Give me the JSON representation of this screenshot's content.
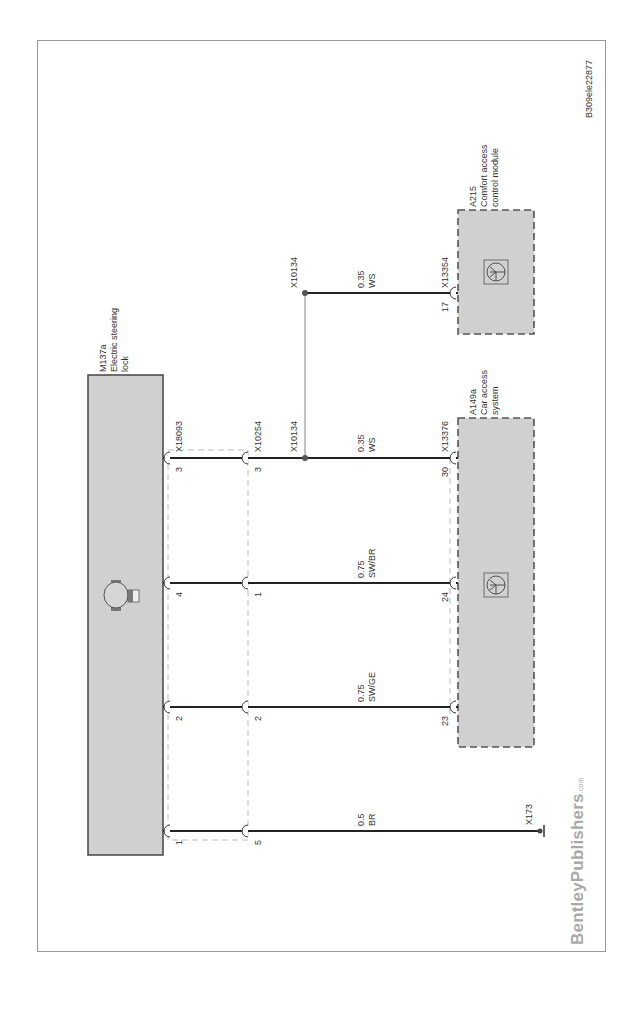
{
  "figure_id": "B309ele22877",
  "publisher_logo": {
    "name": "BentleyPublishers",
    "suffix": ".com"
  },
  "colors": {
    "component_fill": "#d0d0d0",
    "wire": "#222222",
    "frame": "#9a9a9a",
    "dashed_outline": "#555555",
    "logo": "#a9a9a9"
  },
  "components": {
    "m137a": {
      "id": "M137a",
      "name_line1": "Electric steering",
      "name_line2": "lock"
    },
    "a149a": {
      "id": "A149a",
      "name_line1": "Car access",
      "name_line2": "system"
    },
    "a215": {
      "id": "A215",
      "name_line1": "Comfort access",
      "name_line2": "control module"
    }
  },
  "connectors": {
    "x18093": "X18093",
    "x10254": "X10254",
    "x13376": "X13376",
    "x13354": "X13354",
    "x173": "X173",
    "splice_x10134": "X10134"
  },
  "wires": [
    {
      "m137a_pin": "3",
      "x10254_pin": "3",
      "end_pin": "30",
      "gauge": "0.35",
      "color": "WS"
    },
    {
      "m137a_pin": "4",
      "x10254_pin": "1",
      "end_pin": "24",
      "gauge": "0.75",
      "color": "SW/BR"
    },
    {
      "m137a_pin": "2",
      "x10254_pin": "2",
      "end_pin": "23",
      "gauge": "0.75",
      "color": "SW/GE"
    },
    {
      "m137a_pin": "1",
      "x10254_pin": "5",
      "end_pin": "",
      "gauge": "0.5",
      "color": "BR"
    }
  ],
  "branch_wire": {
    "end_pin": "17",
    "gauge": "0.35",
    "color": "WS"
  },
  "motor_symbol_label": "M"
}
